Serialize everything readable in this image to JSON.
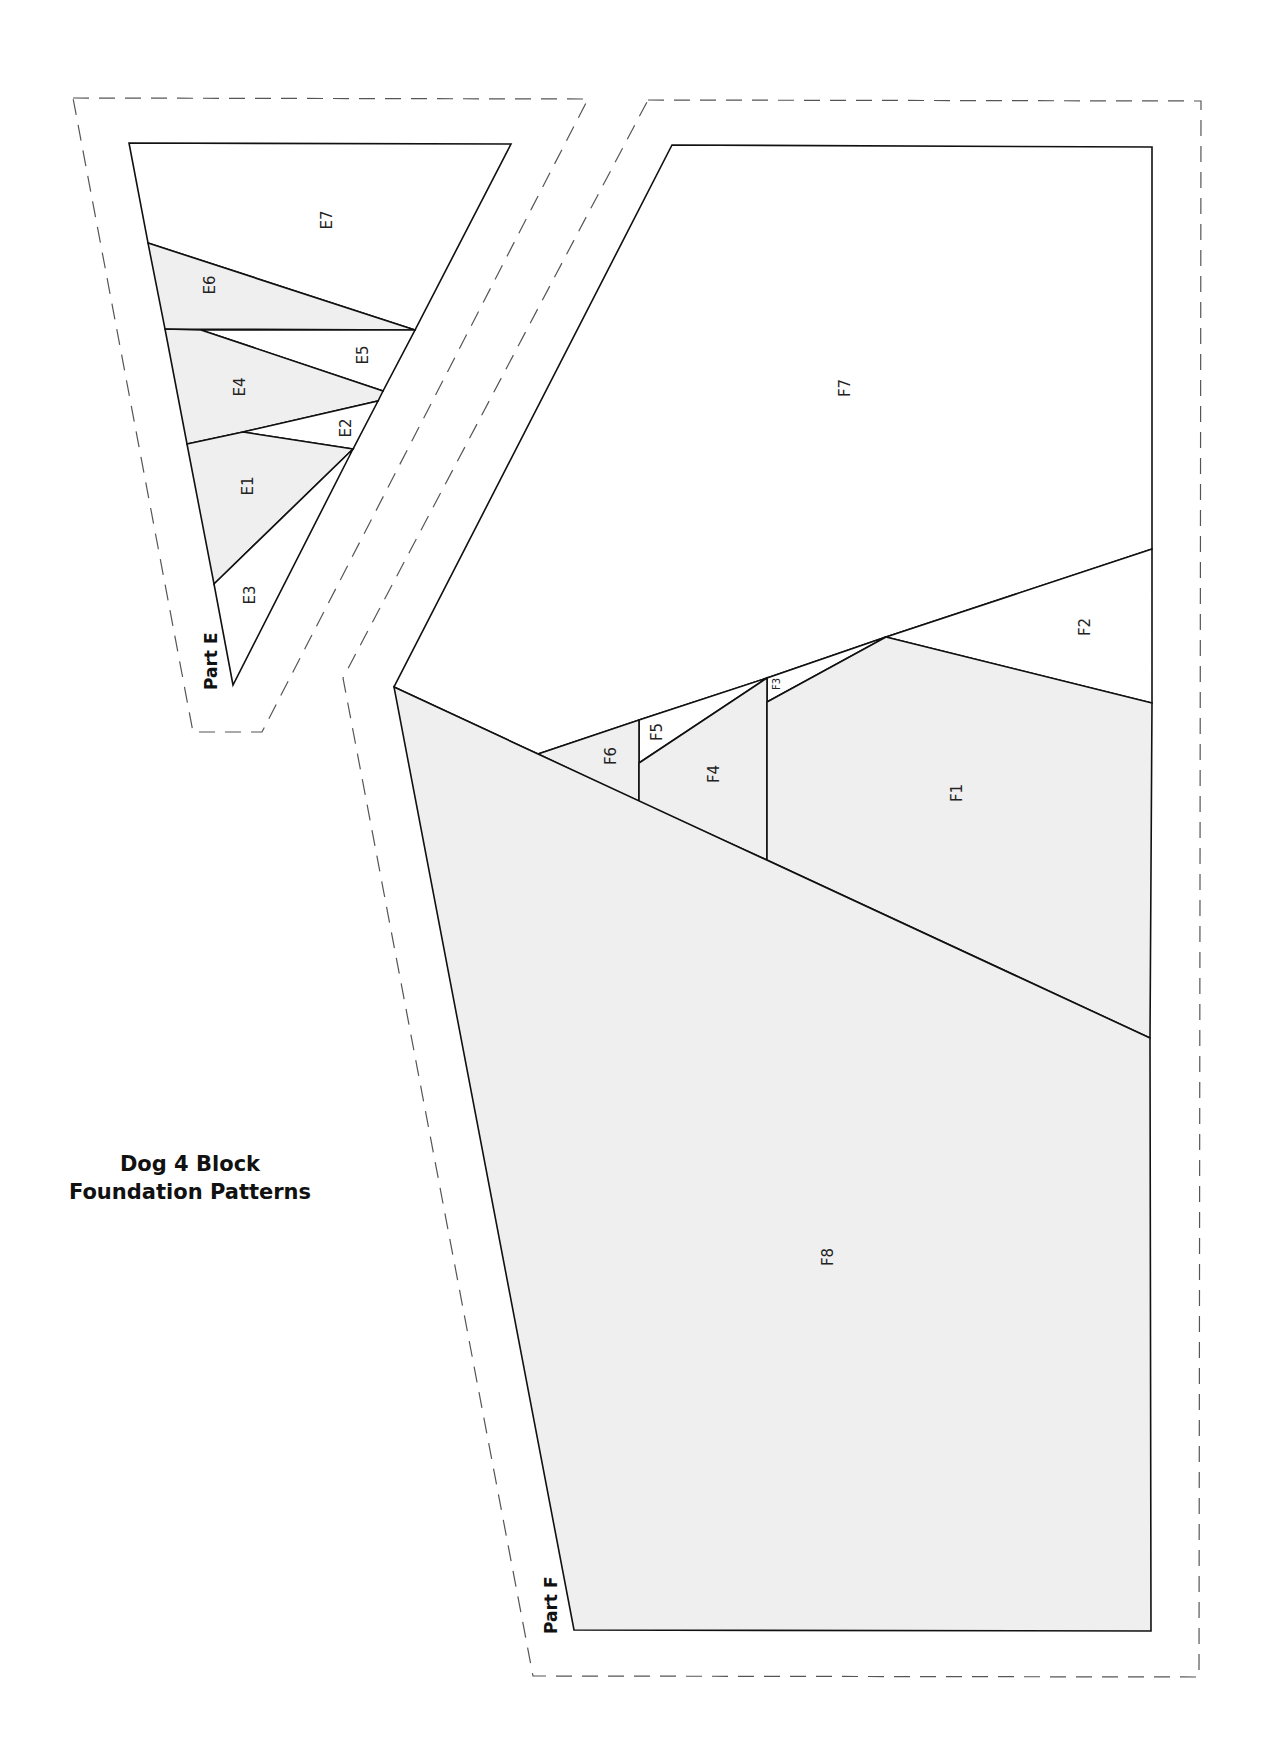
{
  "title": {
    "line1": "Dog 4 Block",
    "line2": "Foundation Patterns"
  },
  "colors": {
    "shade": "#efefef",
    "line": "#111111",
    "dash": "#555555",
    "background": "#ffffff"
  },
  "parts": [
    {
      "name": "Part E",
      "label": "Part E",
      "seam_allowance_outline": [
        [
          73,
          98
        ],
        [
          588,
          99
        ],
        [
          262,
          732
        ],
        [
          193,
          732
        ]
      ],
      "pieces": [
        {
          "id": "E7",
          "shaded": false,
          "points": [
            [
              129,
              143
            ],
            [
              511,
              144
            ],
            [
              415,
              330
            ],
            [
              148,
              243
            ]
          ],
          "label_pos": [
            327,
            220
          ]
        },
        {
          "id": "E6",
          "shaded": true,
          "points": [
            [
              148,
              243
            ],
            [
              415,
              330
            ],
            [
              165,
              329
            ]
          ],
          "label_pos": [
            210,
            285
          ]
        },
        {
          "id": "E5",
          "shaded": false,
          "points": [
            [
              201,
              330
            ],
            [
              415,
              330
            ],
            [
              383,
              391
            ]
          ],
          "label_pos": [
            363,
            355
          ]
        },
        {
          "id": "E4",
          "shaded": true,
          "points": [
            [
              165,
              329
            ],
            [
              201,
              330
            ],
            [
              383,
              391
            ],
            [
              378,
              401
            ],
            [
              243,
              432
            ],
            [
              187,
              444
            ]
          ],
          "label_pos": [
            240,
            387
          ]
        },
        {
          "id": "E2",
          "shaded": false,
          "points": [
            [
              243,
              432
            ],
            [
              378,
              401
            ],
            [
              353,
              449
            ]
          ],
          "label_pos": [
            346,
            428
          ]
        },
        {
          "id": "E1",
          "shaded": true,
          "points": [
            [
              187,
              444
            ],
            [
              243,
              432
            ],
            [
              353,
              449
            ],
            [
              214,
              584
            ]
          ],
          "label_pos": [
            248,
            486
          ]
        },
        {
          "id": "E3",
          "shaded": false,
          "points": [
            [
              214,
              584
            ],
            [
              353,
              449
            ],
            [
              233,
              685
            ]
          ],
          "label_pos": [
            250,
            595
          ]
        }
      ]
    },
    {
      "name": "Part F",
      "label": "Part F",
      "seam_allowance_outline": [
        [
          648,
          100
        ],
        [
          1201,
          101
        ],
        [
          1199,
          1677
        ],
        [
          533,
          1676
        ],
        [
          343,
          678
        ]
      ],
      "pieces": [
        {
          "id": "F7",
          "shaded": false,
          "points": [
            [
              672,
              145
            ],
            [
              1152,
              147
            ],
            [
              1152,
              549
            ],
            [
              886,
              637
            ],
            [
              767,
              678
            ],
            [
              639,
              720
            ],
            [
              538,
              754
            ],
            [
              394,
              687
            ]
          ],
          "label_pos": [
            845,
            388
          ]
        },
        {
          "id": "F2",
          "shaded": false,
          "points": [
            [
              886,
              637
            ],
            [
              1152,
              549
            ],
            [
              1152,
              703
            ]
          ],
          "label_pos": [
            1085,
            627
          ]
        },
        {
          "id": "F3",
          "shaded": false,
          "points": [
            [
              767,
              678
            ],
            [
              886,
              637
            ],
            [
              767,
              702
            ]
          ],
          "label_pos": [
            776,
            684
          ],
          "small": true
        },
        {
          "id": "F5",
          "shaded": false,
          "points": [
            [
              639,
              720
            ],
            [
              767,
              678
            ],
            [
              639,
              763
            ]
          ],
          "label_pos": [
            657,
            732
          ]
        },
        {
          "id": "F6",
          "shaded": true,
          "points": [
            [
              538,
              754
            ],
            [
              639,
              720
            ],
            [
              639,
              802
            ]
          ],
          "label_pos": [
            611,
            756
          ]
        },
        {
          "id": "F4",
          "shaded": true,
          "points": [
            [
              639,
              763
            ],
            [
              767,
              678
            ],
            [
              767,
              860
            ],
            [
              639,
              802
            ]
          ],
          "label_pos": [
            714,
            774
          ]
        },
        {
          "id": "F1",
          "shaded": true,
          "points": [
            [
              767,
              702
            ],
            [
              886,
              637
            ],
            [
              1152,
              703
            ],
            [
              1150,
              1038
            ],
            [
              767,
              860
            ]
          ],
          "label_pos": [
            957,
            793
          ]
        },
        {
          "id": "F8",
          "shaded": true,
          "points": [
            [
              394,
              687
            ],
            [
              538,
              754
            ],
            [
              1150,
              1038
            ],
            [
              1151,
              1631
            ],
            [
              574,
              1630
            ]
          ],
          "label_pos": [
            828,
            1257
          ]
        }
      ]
    }
  ],
  "part_labels": [
    {
      "text": "Part E",
      "pos": [
        217,
        690
      ]
    },
    {
      "text": "Part F",
      "pos": [
        557,
        1634
      ]
    }
  ]
}
